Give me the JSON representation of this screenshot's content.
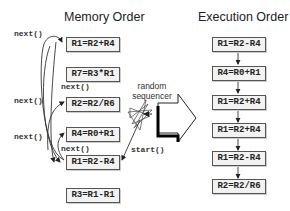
{
  "titles": {
    "memory": "Memory Order",
    "execution": "Execution Order"
  },
  "memory_order": [
    "R1=R2+R4",
    "R7=R3*R1",
    "R2=R2/R6",
    "R4=R0+R1",
    "R1=R2-R4",
    "R3=R1-R1"
  ],
  "execution_order": [
    "R1=R2-R4",
    "R4=R0+R1",
    "R1=R2+R4",
    "R1=R2+R4",
    "R1=R2-R4",
    "R2=R2/R6"
  ],
  "labels": {
    "next_1": "next()",
    "next_2": "next()",
    "next_3": "next()",
    "next_4": "next()",
    "next_5": "next()",
    "start": "start()",
    "sequencer_line1": "random",
    "sequencer_line2": "sequencer"
  }
}
